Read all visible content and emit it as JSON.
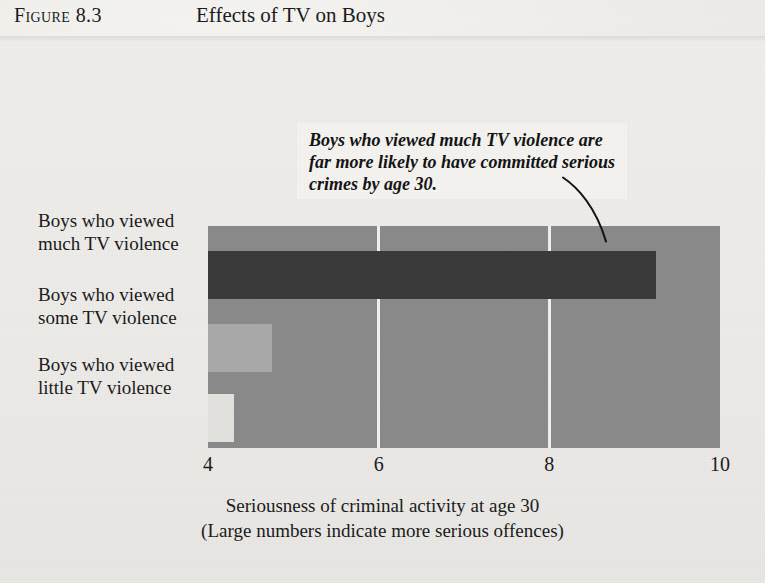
{
  "figure": {
    "label_prefix": "Figure",
    "label_number": "8.3",
    "title": "Effects of TV on Boys"
  },
  "annotation": {
    "text": "Boys who viewed much TV violence are far more likely to have committed serious crimes by age 30.",
    "leader_icon": "curved-leader-line"
  },
  "chart_data": {
    "type": "bar",
    "orientation": "horizontal",
    "title": "Effects of TV on Boys",
    "xlabel": "Seriousness of criminal activity at age 30",
    "xlabel_sub": "(Large numbers indicate more serious offences)",
    "ylabel": "",
    "categories": [
      "Boys who viewed much TV violence",
      "Boys who viewed some TV violence",
      "Boys who viewed little TV violence"
    ],
    "category_lines": [
      [
        "Boys who viewed",
        "much TV violence"
      ],
      [
        "Boys who viewed",
        "some TV violence"
      ],
      [
        "Boys who viewed",
        "little TV violence"
      ]
    ],
    "values": [
      9.25,
      4.75,
      4.3
    ],
    "bar_colors": [
      "#3a3a3a",
      "#a9a9a9",
      "#e2e1dd"
    ],
    "xlim": [
      4,
      10
    ],
    "xticks": [
      4,
      6,
      8,
      10
    ],
    "xtick_labels": [
      "4",
      "6",
      "8",
      "10"
    ],
    "gridlines": [
      6,
      8
    ],
    "grid": true,
    "grid_color": "#f0efec",
    "plot_background": "#8a8a8a",
    "legend": "none",
    "annotations": [
      {
        "text": "Boys who viewed much TV violence are far more likely to have committed serious crimes by age 30.",
        "points_to": "Boys who viewed much TV violence"
      }
    ]
  },
  "axis": {
    "caption_line1": "Seriousness of criminal activity at age 30",
    "caption_line2": "(Large numbers indicate more serious offences)"
  }
}
